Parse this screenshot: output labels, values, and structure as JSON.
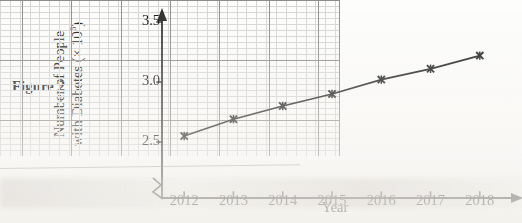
{
  "figure": {
    "caption": "Figure 2"
  },
  "axis": {
    "y_title_line1": "Number of People",
    "y_title_line2_prefix": "with Diabetes (× 10",
    "y_title_exponent": "6",
    "y_title_suffix": ")",
    "x_title": "Year",
    "y_tick_labels": [
      "3.5",
      "3.0",
      "2.5"
    ],
    "x_tick_labels": [
      "2012",
      "2013",
      "2014",
      "2015",
      "2016",
      "2017",
      "2018"
    ],
    "break_symbol": "axis-break-zigzag"
  },
  "style": {
    "line_color": "#1a1a1a",
    "marker_color": "#1a1a1a",
    "axis_color": "#2a2a2a",
    "major_grid_color": "#8d8d8d",
    "minor_grid_color": "#d6d6d6",
    "text_color": "#141414",
    "background": "#fdfdfc"
  },
  "chart_data": {
    "type": "line",
    "title": "",
    "subtitle": "",
    "xlabel": "Year",
    "ylabel": "Number of People with Diabetes (× 10⁶)",
    "categories": [
      "2012",
      "2013",
      "2014",
      "2015",
      "2016",
      "2017",
      "2018"
    ],
    "x": [
      2012,
      2013,
      2014,
      2015,
      2016,
      2017,
      2018
    ],
    "values": [
      2.55,
      2.69,
      2.8,
      2.9,
      3.02,
      3.11,
      3.22
    ],
    "series": [
      {
        "name": "Number of People with Diabetes",
        "values": [
          2.55,
          2.69,
          2.8,
          2.9,
          3.02,
          3.11,
          3.22
        ]
      }
    ],
    "ylim": [
      2.2,
      3.5
    ],
    "xlim": [
      2011.55,
      2018.45
    ],
    "y_major_ticks": [
      2.5,
      3.0,
      3.5
    ],
    "y_minor_step": 0.05,
    "x_major_ticks": [
      2012,
      2013,
      2014,
      2015,
      2016,
      2017,
      2018
    ],
    "y_axis_broken": true,
    "grid": true,
    "grid_style": "graph-paper minor and major",
    "legend": false,
    "legend_position": "none",
    "marker": "x-star",
    "units": "millions (×10⁶)"
  }
}
